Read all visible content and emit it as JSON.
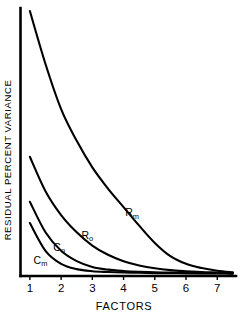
{
  "chart_data": {
    "type": "line",
    "title": "",
    "xlabel": "FACTORS",
    "ylabel": "RESIDUAL PERCENT VARIANCE",
    "xlim": [
      0.7,
      7.6
    ],
    "ylim": [
      0,
      100
    ],
    "xticks": [
      "1",
      "2",
      "3",
      "4",
      "5",
      "6",
      "7"
    ],
    "xtick_values": [
      1,
      2,
      3,
      4,
      5,
      6,
      7
    ],
    "yticks": [],
    "grid": false,
    "legend": "inline-curve-labels",
    "line_color": "#000000",
    "background_color": "#ffffff",
    "x": [
      1,
      1.5,
      2,
      2.5,
      3,
      3.5,
      4,
      4.5,
      5,
      5.5,
      6,
      6.5,
      7,
      7.5
    ],
    "series": [
      {
        "name": "Rm",
        "label_base": "R",
        "label_sub": "m",
        "label_x": 4.05,
        "label_y": 22.5,
        "values": [
          100,
          80,
          63,
          51,
          41,
          33,
          26,
          19,
          12.5,
          7.5,
          4.6,
          3.0,
          2.0,
          1.4
        ]
      },
      {
        "name": "Ro",
        "label_base": "R",
        "label_sub": "o",
        "label_x": 2.65,
        "label_y": 14.0,
        "values": [
          45,
          32,
          23,
          16.5,
          11.5,
          8.0,
          5.6,
          4.0,
          2.9,
          2.2,
          1.8,
          1.5,
          1.3,
          1.1
        ]
      },
      {
        "name": "Co",
        "label_base": "C",
        "label_sub": "o",
        "label_x": 1.75,
        "label_y": 9.5,
        "values": [
          28,
          16.5,
          9.5,
          5.6,
          3.4,
          2.4,
          1.9,
          1.6,
          1.4,
          1.3,
          1.2,
          1.1,
          1.05,
          1.0
        ]
      },
      {
        "name": "Cm",
        "label_base": "C",
        "label_sub": "m",
        "label_x": 1.12,
        "label_y": 4.6,
        "values": [
          20,
          9.5,
          4.6,
          2.6,
          1.8,
          1.5,
          1.3,
          1.2,
          1.1,
          1.05,
          1.0,
          1.0,
          0.95,
          0.9
        ]
      }
    ]
  }
}
